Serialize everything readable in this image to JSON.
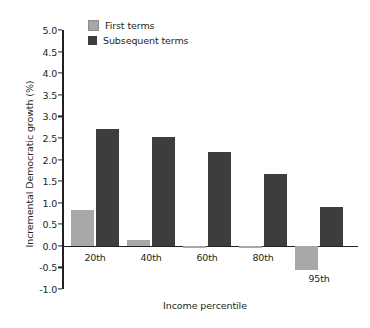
{
  "chart_data": {
    "type": "bar",
    "title": "",
    "xlabel": "Income percentile",
    "ylabel": "Incremental Democratic growth (%)",
    "categories": [
      "20th",
      "40th",
      "60th",
      "80th",
      "95th"
    ],
    "series": [
      {
        "name": "First terms",
        "color": "#a8a8a8",
        "values": [
          0.82,
          0.13,
          -0.05,
          -0.05,
          -0.55
        ]
      },
      {
        "name": "Subsequent terms",
        "color": "#3d3d3d",
        "values": [
          2.7,
          2.51,
          2.18,
          1.67,
          0.9
        ]
      }
    ],
    "ylim": [
      -1.0,
      5.0
    ],
    "yticks": [
      "5.0",
      "4.5",
      "4.0",
      "3.5",
      "3.0",
      "2.5",
      "2.0",
      "1.5",
      "1.0",
      "0.5",
      "0.0",
      "-0.5",
      "-1.0"
    ],
    "ytick_values": [
      5.0,
      4.5,
      4.0,
      3.5,
      3.0,
      2.5,
      2.0,
      1.5,
      1.0,
      0.5,
      0.0,
      -0.5,
      -1.0
    ],
    "grid": false,
    "legend_position": "top-left"
  }
}
